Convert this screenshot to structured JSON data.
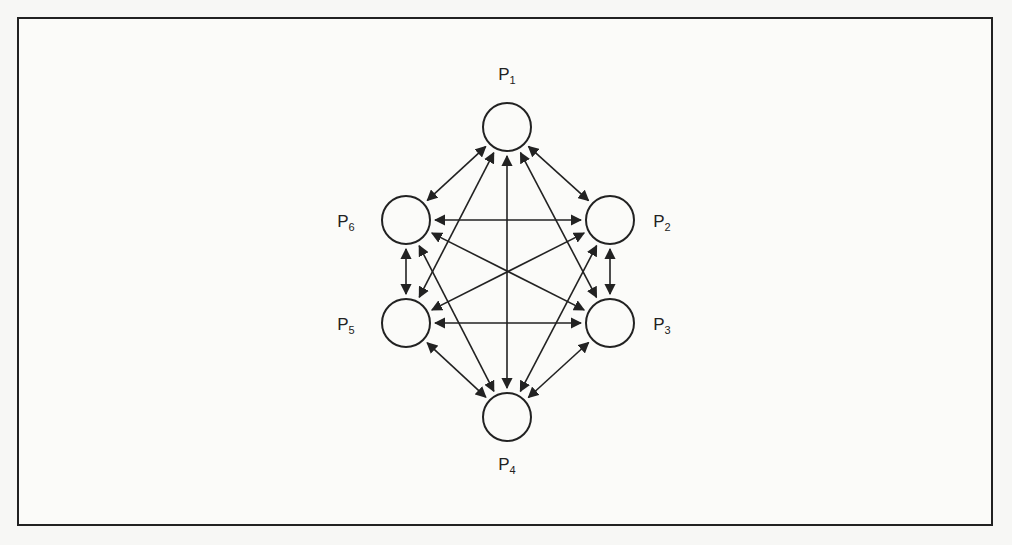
{
  "diagram": {
    "type": "complete-graph",
    "colors": {
      "stroke": "#222222",
      "background": "#fbfbf9"
    },
    "nodes": [
      {
        "id": "P1",
        "label": "P",
        "subscript": "1",
        "cx": 507,
        "cy": 127,
        "r": 24,
        "lx": 507,
        "ly": 80
      },
      {
        "id": "P2",
        "label": "P",
        "subscript": "2",
        "cx": 610,
        "cy": 220,
        "r": 24,
        "lx": 662,
        "ly": 227
      },
      {
        "id": "P3",
        "label": "P",
        "subscript": "3",
        "cx": 610,
        "cy": 323,
        "r": 24,
        "lx": 662,
        "ly": 330
      },
      {
        "id": "P4",
        "label": "P",
        "subscript": "4",
        "cx": 507,
        "cy": 417,
        "r": 24,
        "lx": 507,
        "ly": 470
      },
      {
        "id": "P5",
        "label": "P",
        "subscript": "5",
        "cx": 406,
        "cy": 323,
        "r": 24,
        "lx": 346,
        "ly": 330
      },
      {
        "id": "P6",
        "label": "P",
        "subscript": "6",
        "cx": 406,
        "cy": 220,
        "r": 24,
        "lx": 346,
        "ly": 227
      }
    ],
    "edges": [
      [
        "P1",
        "P2"
      ],
      [
        "P1",
        "P3"
      ],
      [
        "P1",
        "P4"
      ],
      [
        "P1",
        "P5"
      ],
      [
        "P1",
        "P6"
      ],
      [
        "P2",
        "P3"
      ],
      [
        "P2",
        "P4"
      ],
      [
        "P2",
        "P5"
      ],
      [
        "P2",
        "P6"
      ],
      [
        "P3",
        "P4"
      ],
      [
        "P3",
        "P5"
      ],
      [
        "P3",
        "P6"
      ],
      [
        "P4",
        "P5"
      ],
      [
        "P4",
        "P6"
      ],
      [
        "P5",
        "P6"
      ]
    ],
    "edge_style": "bidirectional-arrow"
  }
}
